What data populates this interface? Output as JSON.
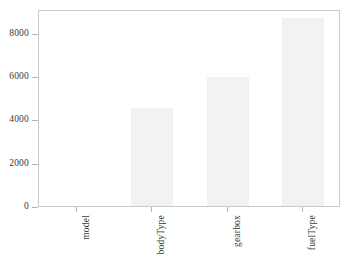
{
  "chart_data": {
    "type": "bar",
    "title": "",
    "subtitle": "",
    "xlabel": "",
    "ylabel": "",
    "categories": [
      "model",
      "bodyType",
      "gearbox",
      "fuelType"
    ],
    "values": [
      0,
      4506,
      5981,
      8680
    ],
    "series": [
      {
        "name": "missing values",
        "values": [
          0,
          4506,
          5981,
          8680
        ]
      }
    ],
    "ylim": [
      0,
      9100
    ],
    "yticks": [
      0,
      2000,
      4000,
      6000,
      8000
    ],
    "ytick_labels": [
      "0",
      "2000",
      "4000",
      "6000",
      "8000"
    ],
    "xtick_labels": [
      "model",
      "bodyType",
      "gearbox",
      "fuelType"
    ],
    "grid": false,
    "legend": null,
    "legend_position": "none",
    "bar_color": "#f2f2f2",
    "axis_color": "#c9c9c9",
    "text_color": "#3a3a3a",
    "annotations": []
  },
  "axes": {
    "y_ticks": [
      {
        "label": "8000",
        "value": 8000
      },
      {
        "label": "6000",
        "value": 6000
      },
      {
        "label": "4000",
        "value": 4000
      },
      {
        "label": "2000",
        "value": 2000
      },
      {
        "label": "0",
        "value": 0
      }
    ],
    "x_ticks": [
      {
        "label": "model"
      },
      {
        "label": "bodyType"
      },
      {
        "label": "gearbox"
      },
      {
        "label": "fuelType"
      }
    ]
  }
}
